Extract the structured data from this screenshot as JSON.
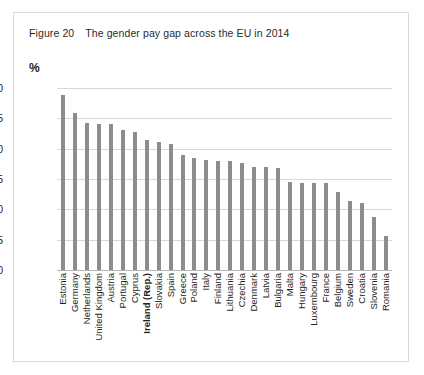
{
  "figure": {
    "number": "Figure 20",
    "title": "The gender pay gap across the EU in 2014",
    "unit_label": "%"
  },
  "chart_data": {
    "type": "bar",
    "title": "The gender pay gap across the EU in 2014",
    "xlabel": "",
    "ylabel": "%",
    "ylim": [
      0,
      30
    ],
    "yticks": [
      0,
      5,
      10,
      15,
      20,
      25,
      30
    ],
    "grid": true,
    "legend": "none",
    "bar_color": "#8c8c8c",
    "highlight_category": "Ireland (Rep.)",
    "categories": [
      "Estonia",
      "Germany",
      "Netherlands",
      "United Kingdom",
      "Austria",
      "Portugal",
      "Cyprus",
      "Ireland (Rep.)",
      "Slovakia",
      "Spain",
      "Greece",
      "Poland",
      "Italy",
      "Finland",
      "Lithuania",
      "Czechia",
      "Denmark",
      "Latvia",
      "Bulgaria",
      "Malta",
      "Hungary",
      "Luxembourg",
      "France",
      "Belgium",
      "Sweden",
      "Croatia",
      "Slovenia",
      "Romania"
    ],
    "values": [
      28.9,
      25.9,
      24.2,
      24.1,
      24.0,
      23.0,
      22.8,
      21.5,
      21.1,
      20.8,
      19.0,
      18.4,
      18.2,
      18.0,
      17.9,
      17.6,
      17.0,
      16.9,
      16.8,
      14.5,
      14.4,
      14.3,
      14.3,
      12.9,
      11.3,
      11.0,
      8.7,
      5.6
    ]
  }
}
